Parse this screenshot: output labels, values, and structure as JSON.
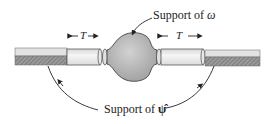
{
  "diagram": {
    "type": "support-illustration",
    "labels": {
      "top_label_prefix": "Support of ",
      "top_symbol": "ω",
      "bottom_label_prefix": "Support of ",
      "bottom_symbol": "ψ̂",
      "left_width_label": "T",
      "right_width_label": "T"
    },
    "colors": {
      "rod_light": "#e6e6e6",
      "rod_hatch": "#8a8a8a",
      "bulb": "#bdbdbd",
      "stroke": "#333333"
    }
  }
}
